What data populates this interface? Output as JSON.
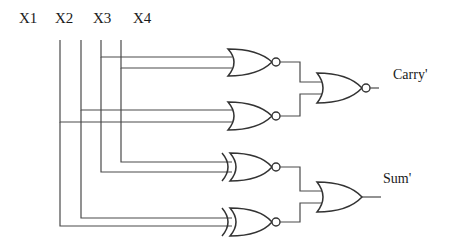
{
  "diagram": {
    "type": "logic-circuit",
    "inputs": [
      {
        "id": "X1",
        "label": "X1",
        "x": 60
      },
      {
        "id": "X2",
        "label": "X2",
        "x": 81
      },
      {
        "id": "X3",
        "label": "X3",
        "x": 101
      },
      {
        "id": "X4",
        "label": "X4",
        "x": 121
      }
    ],
    "gates": [
      {
        "id": "g1",
        "kind": "NOR",
        "inputs": [
          "X3",
          "X4"
        ]
      },
      {
        "id": "g2",
        "kind": "NOR",
        "inputs": [
          "X2",
          "X1"
        ]
      },
      {
        "id": "g3",
        "kind": "XNOR",
        "inputs": [
          "X4",
          "X3"
        ]
      },
      {
        "id": "g4",
        "kind": "XNOR",
        "inputs": [
          "X2",
          "X1"
        ]
      },
      {
        "id": "g5",
        "kind": "NOR",
        "inputs": [
          "g1",
          "g2"
        ],
        "output": "Carry'"
      },
      {
        "id": "g6",
        "kind": "OR",
        "inputs": [
          "g3",
          "g4"
        ],
        "output": "Sum'"
      }
    ],
    "outputs": [
      {
        "id": "carry",
        "label": "Carry'"
      },
      {
        "id": "sum",
        "label": "Sum'"
      }
    ],
    "colors": {
      "wire": "#4a4a4a",
      "gate": "#333333",
      "text": "#1a1a1a",
      "background": "#ffffff"
    }
  }
}
